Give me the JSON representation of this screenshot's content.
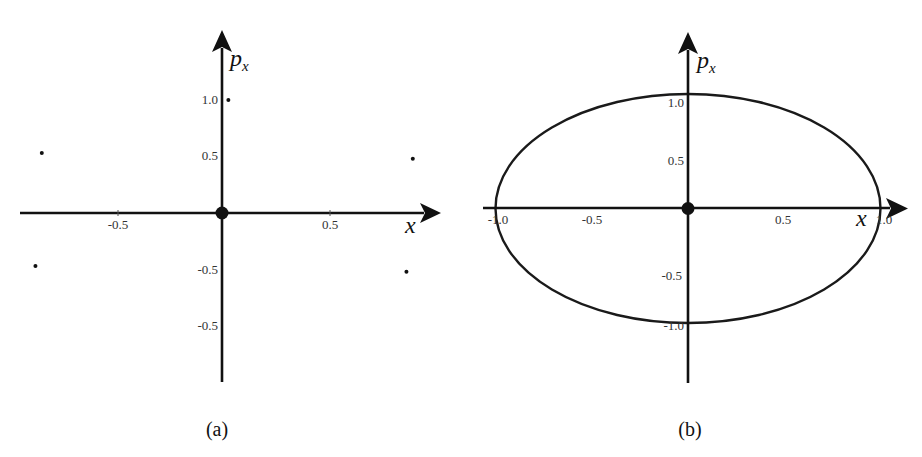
{
  "panels": [
    {
      "caption": "(a)",
      "x_axis_label": "x",
      "y_axis_label_main": "p",
      "y_axis_label_sub": "x",
      "x_ticks": [
        "-0.5",
        "0.5"
      ],
      "y_ticks": [
        "1.0",
        "0.5",
        "-0.5",
        "-0.5"
      ]
    },
    {
      "caption": "(b)",
      "x_axis_label": "x",
      "y_axis_label_main": "p",
      "y_axis_label_sub": "x",
      "x_ticks": [
        "-1.0",
        "-0.5",
        "0.5",
        "1.0"
      ],
      "y_ticks": [
        "1.0",
        "0.5",
        "-0.5",
        "-1.0"
      ]
    }
  ],
  "chart_data": [
    {
      "type": "scatter",
      "title": "(a)",
      "xlabel": "x",
      "ylabel": "p_x",
      "xlim": [
        -0.95,
        1.0
      ],
      "ylim": [
        -1.5,
        1.6
      ],
      "grid": false,
      "x_tick_labels": [
        "-0.5",
        "0.5"
      ],
      "y_tick_labels": [
        "1.0",
        "0.5",
        "-0.5",
        "-0.5"
      ],
      "series": [
        {
          "name": "fixed point",
          "marker": "large",
          "points": [
            [
              0.0,
              0.0
            ]
          ]
        },
        {
          "name": "iterates",
          "marker": "small",
          "points": [
            [
              0.03,
              1.0
            ],
            [
              -0.85,
              0.53
            ],
            [
              0.9,
              0.48
            ],
            [
              -0.88,
              -0.47
            ],
            [
              0.87,
              -0.52
            ]
          ]
        }
      ]
    },
    {
      "type": "line",
      "title": "(b)",
      "xlabel": "x",
      "ylabel": "p_x",
      "xlim": [
        -1.05,
        1.15
      ],
      "ylim": [
        -1.5,
        1.55
      ],
      "grid": false,
      "x_tick_labels": [
        "-1.0",
        "-0.5",
        "0.5",
        "1.0"
      ],
      "y_tick_labels": [
        "1.0",
        "0.5",
        "-0.5",
        "-1.0"
      ],
      "series": [
        {
          "name": "orbit",
          "shape": "ellipse",
          "center": [
            0.0,
            0.0
          ],
          "semi_axes": [
            1.0,
            1.0
          ]
        },
        {
          "name": "fixed point",
          "marker": "large",
          "points": [
            [
              0.0,
              0.0
            ]
          ]
        }
      ]
    }
  ]
}
